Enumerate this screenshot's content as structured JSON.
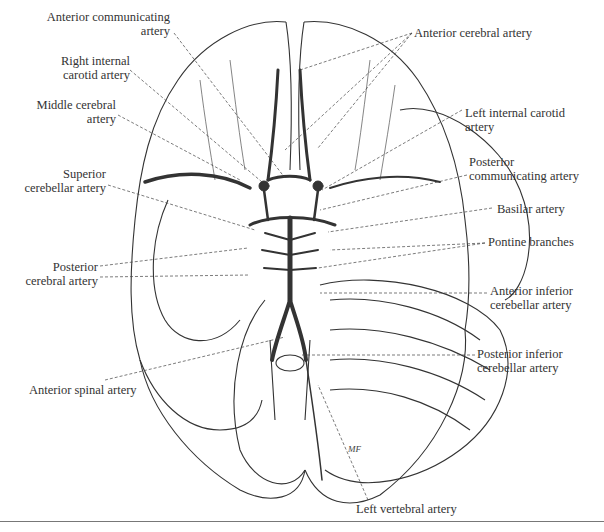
{
  "figure": {
    "signature": "MF",
    "labels": {
      "anterior_communicating": [
        "Anterior communicating",
        "artery"
      ],
      "right_internal_carotid": [
        "Right internal",
        "carotid artery"
      ],
      "middle_cerebral": [
        "Middle cerebral",
        "artery"
      ],
      "superior_cerebellar": [
        "Superior",
        "cerebellar artery"
      ],
      "posterior_cerebral": [
        "Posterior",
        "cerebral artery"
      ],
      "anterior_spinal": [
        "Anterior spinal artery"
      ],
      "anterior_cerebral": [
        "Anterior cerebral artery"
      ],
      "left_internal_carotid": [
        "Left internal carotid",
        "artery"
      ],
      "posterior_communicating": [
        "Posterior",
        "communicating artery"
      ],
      "basilar": [
        "Basilar artery"
      ],
      "pontine_branches": [
        "Pontine branches"
      ],
      "anterior_inferior_cerebellar": [
        "Anterior inferior",
        "cerebellar artery"
      ],
      "posterior_inferior_cerebellar": [
        "Posterior inferior",
        "cerebellar artery"
      ],
      "left_vertebral": [
        "Left vertebral artery"
      ]
    },
    "colors": {
      "line": "#2b2b2b",
      "artery": "#333333",
      "leader": "#444444"
    }
  }
}
